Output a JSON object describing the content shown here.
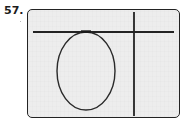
{
  "figure": {
    "problem_number": "57.",
    "caption": "",
    "background_color": "#ededed",
    "page_color": "#ffffff",
    "ink_color": "#232323",
    "frame": {
      "name": "rounded-rectangle-frame",
      "x": 27,
      "y": 9,
      "width": 153,
      "height": 109,
      "corner_radius": 5,
      "stroke_width": 1.4
    },
    "elements": [
      {
        "name": "horizontal-line",
        "type": "line",
        "x1": 33,
        "y1": 32,
        "x2": 174,
        "y2": 32,
        "stroke_width": 1.8
      },
      {
        "name": "vertical-line",
        "type": "line",
        "x1": 134,
        "y1": 12,
        "x2": 134,
        "y2": 116,
        "stroke_width": 1.8
      },
      {
        "name": "ellipse",
        "type": "ellipse",
        "cx": 86,
        "cy": 71,
        "rx": 29,
        "ry": 39,
        "stroke_width": 1.4,
        "fill": "none",
        "tangent_to": "horizontal-line"
      },
      {
        "name": "tangent-point-mark",
        "type": "point",
        "x": 86,
        "y": 32
      }
    ]
  }
}
